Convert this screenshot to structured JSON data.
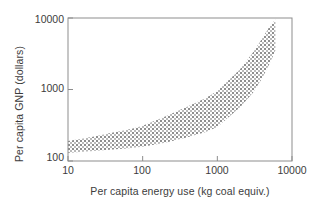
{
  "chart_data": {
    "type": "area",
    "title": "",
    "subtitle": "",
    "xlabel": "Per capita energy use (kg coal equiv.)",
    "ylabel": "Per capita GNP (dollars)",
    "xscale": "log",
    "yscale": "log",
    "xlim": [
      10,
      10000
    ],
    "ylim": [
      100,
      10000
    ],
    "xticks": [
      "10",
      "100",
      "1000",
      "10000"
    ],
    "xtick_values": [
      10,
      100,
      1000,
      10000
    ],
    "yticks": [
      "100",
      "1000",
      "10000"
    ],
    "ytick_values": [
      100,
      1000,
      10000
    ],
    "grid": false,
    "legend": null,
    "legend_position": "none",
    "annotations": [],
    "fill_style": "stippled-dot-pattern",
    "series": [
      {
        "name": "Per capita GNP band (upper bound)",
        "x": [
          10,
          20,
          40,
          70,
          100,
          200,
          400,
          700,
          1000,
          2000,
          3000,
          4000,
          5000,
          6000
        ],
        "values": [
          190,
          215,
          250,
          280,
          310,
          420,
          580,
          760,
          950,
          1900,
          3300,
          5200,
          7600,
          9500
        ]
      },
      {
        "name": "Per capita GNP band (lower bound)",
        "x": [
          10,
          20,
          40,
          70,
          100,
          200,
          400,
          700,
          1000,
          2000,
          3000,
          4000,
          5000,
          6000
        ],
        "values": [
          130,
          137,
          145,
          152,
          158,
          180,
          215,
          255,
          300,
          560,
          900,
          1450,
          2300,
          3500
        ]
      }
    ]
  }
}
